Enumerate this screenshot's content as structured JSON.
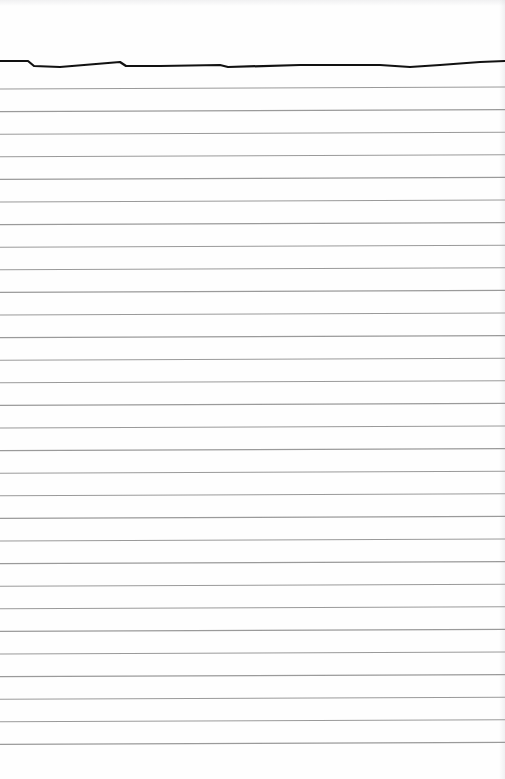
{
  "page": {
    "type": "lined-paper-scan",
    "background": "#ffffff",
    "rule_color": "#9a9a9a",
    "top_stroke_color": "#111111",
    "rule_count": 30,
    "rule_spacing_px": 23,
    "first_rule_y": 88,
    "rule_tilt_px": -2
  },
  "top_stroke": {
    "points": "0,61 28,61 34,66 60,67 120,62 126,66 160,66 220,65 228,67 300,65 380,65 410,67 440,65 480,62 505,61"
  }
}
